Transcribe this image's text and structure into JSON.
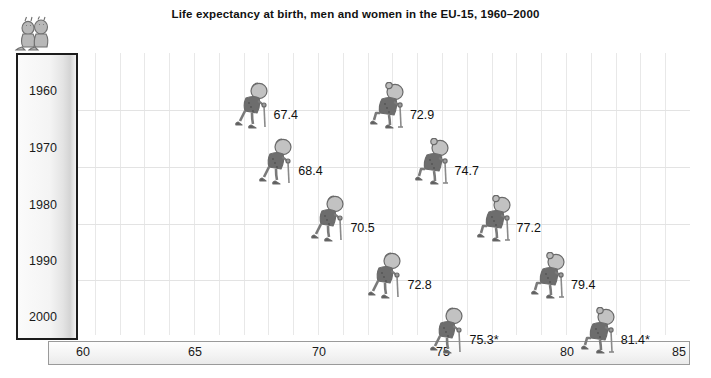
{
  "title": "Life expectancy at birth, men and women in the EU-15, 1960–2000",
  "logo": {
    "name": "two-seated-figures-logo"
  },
  "axes": {
    "y_ticks": [
      "1960",
      "1970",
      "1980",
      "1990",
      "2000"
    ],
    "x_ticks": [
      "60",
      "65",
      "70",
      "75",
      "80",
      "85"
    ]
  },
  "chart_data": {
    "type": "scatter",
    "title": "Life expectancy at birth, men and women in the EU-15, 1960–2000",
    "xlabel": "",
    "ylabel": "",
    "xlim": [
      60,
      85
    ],
    "ylim": [
      1960,
      2000
    ],
    "grid": true,
    "legend": "none",
    "categories": [
      "1960",
      "1970",
      "1980",
      "1990",
      "2000"
    ],
    "series": [
      {
        "name": "Men",
        "values": [
          67.4,
          68.4,
          70.5,
          72.8,
          75.3
        ],
        "labels": [
          "67.4",
          "68.4",
          "70.5",
          "72.8",
          "75.3*"
        ],
        "icon": "elderly-man-with-cane"
      },
      {
        "name": "Women",
        "values": [
          72.9,
          74.7,
          77.2,
          79.4,
          81.4
        ],
        "labels": [
          "72.9",
          "74.7",
          "77.2",
          "79.4",
          "81.4*"
        ],
        "icon": "elderly-woman-with-cane"
      }
    ],
    "annotation": "* provisional"
  },
  "points": [
    {
      "year": "1960",
      "sex": "men",
      "label": "67.4",
      "x": 67.4,
      "y": 1960
    },
    {
      "year": "1960",
      "sex": "women",
      "label": "72.9",
      "x": 72.9,
      "y": 1960
    },
    {
      "year": "1970",
      "sex": "men",
      "label": "68.4",
      "x": 68.4,
      "y": 1970
    },
    {
      "year": "1970",
      "sex": "women",
      "label": "74.7",
      "x": 74.7,
      "y": 1970
    },
    {
      "year": "1980",
      "sex": "men",
      "label": "70.5",
      "x": 70.5,
      "y": 1980
    },
    {
      "year": "1980",
      "sex": "women",
      "label": "77.2",
      "x": 77.2,
      "y": 1980
    },
    {
      "year": "1990",
      "sex": "men",
      "label": "72.8",
      "x": 72.8,
      "y": 1990
    },
    {
      "year": "1990",
      "sex": "women",
      "label": "79.4",
      "x": 79.4,
      "y": 1990
    },
    {
      "year": "2000",
      "sex": "men",
      "label": "75.3*",
      "x": 75.3,
      "y": 2000
    },
    {
      "year": "2000",
      "sex": "women",
      "label": "81.4*",
      "x": 81.4,
      "y": 2000
    }
  ]
}
